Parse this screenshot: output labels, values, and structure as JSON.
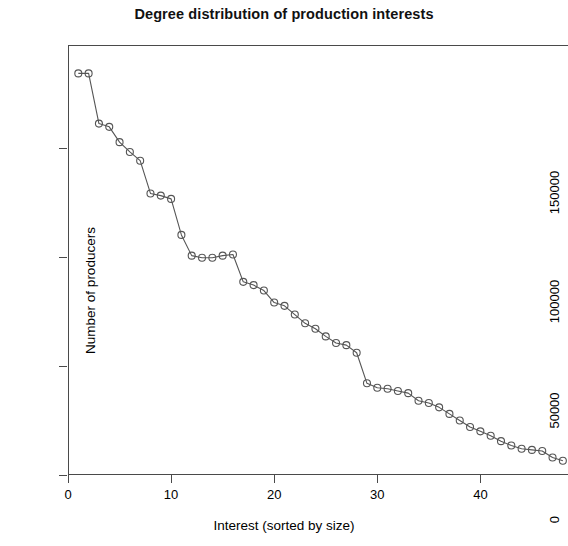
{
  "chart_data": {
    "type": "line",
    "title": "Degree distribution of production interests",
    "subtitle": "",
    "xlabel": "Interest (sorted by size)",
    "ylabel": "Number of producers",
    "xlim": [
      0,
      48.5
    ],
    "ylim": [
      0,
      197000
    ],
    "grid": false,
    "legend": null,
    "marker": "open-circle",
    "line_color": "#555555",
    "marker_color": "#555555",
    "x_ticks": [
      0,
      10,
      20,
      30,
      40
    ],
    "x_tick_labels": [
      "0",
      "10",
      "20",
      "30",
      "40"
    ],
    "y_ticks": [
      0,
      50000,
      100000,
      150000
    ],
    "y_tick_labels": [
      "0",
      "50000",
      "100000",
      "150000"
    ],
    "x": [
      1,
      2,
      3,
      4,
      5,
      6,
      7,
      8,
      9,
      10,
      11,
      12,
      13,
      14,
      15,
      16,
      17,
      18,
      19,
      20,
      21,
      22,
      23,
      24,
      25,
      26,
      27,
      28,
      29,
      30,
      31,
      32,
      33,
      34,
      35,
      36,
      37,
      38,
      39,
      40,
      41,
      42,
      43,
      44,
      45,
      46,
      47,
      48
    ],
    "values": [
      184000,
      184000,
      161000,
      159500,
      152500,
      148000,
      144000,
      129000,
      128000,
      126500,
      110000,
      100500,
      99500,
      99500,
      100500,
      101000,
      88500,
      87000,
      84500,
      79000,
      77500,
      73500,
      69500,
      67000,
      63500,
      60500,
      59500,
      56000,
      42000,
      40000,
      39500,
      38500,
      37500,
      34000,
      33000,
      31000,
      28000,
      25000,
      22000,
      20000,
      18000,
      15500,
      13500,
      12000,
      11500,
      11000,
      8000,
      6500
    ]
  },
  "axes": {
    "y_axis_label": "Number of producers",
    "x_axis_label": "Interest (sorted by size)"
  }
}
